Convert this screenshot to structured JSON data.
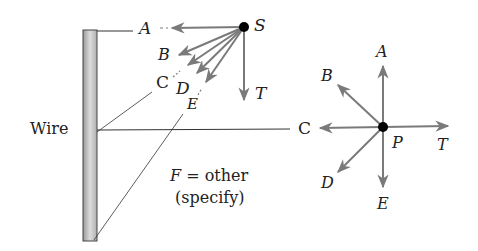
{
  "diagram": {
    "wire_label": "Wire",
    "source_label": "S",
    "point_label": "P",
    "caption_line1": "F = other",
    "caption_line2": "(specify)",
    "left_fan": {
      "A": "A",
      "B": "B",
      "C": "C",
      "D": "D",
      "E": "E",
      "T": "T"
    },
    "right_cross": {
      "A": "A",
      "B": "B",
      "C": "C",
      "D": "D",
      "E": "E",
      "T": "T"
    },
    "colors": {
      "arrow": "#7a7a7a",
      "line": "#333333",
      "dot": "#000000",
      "wire_fill": "#c8c8c8",
      "wire_edge": "#444444"
    }
  }
}
